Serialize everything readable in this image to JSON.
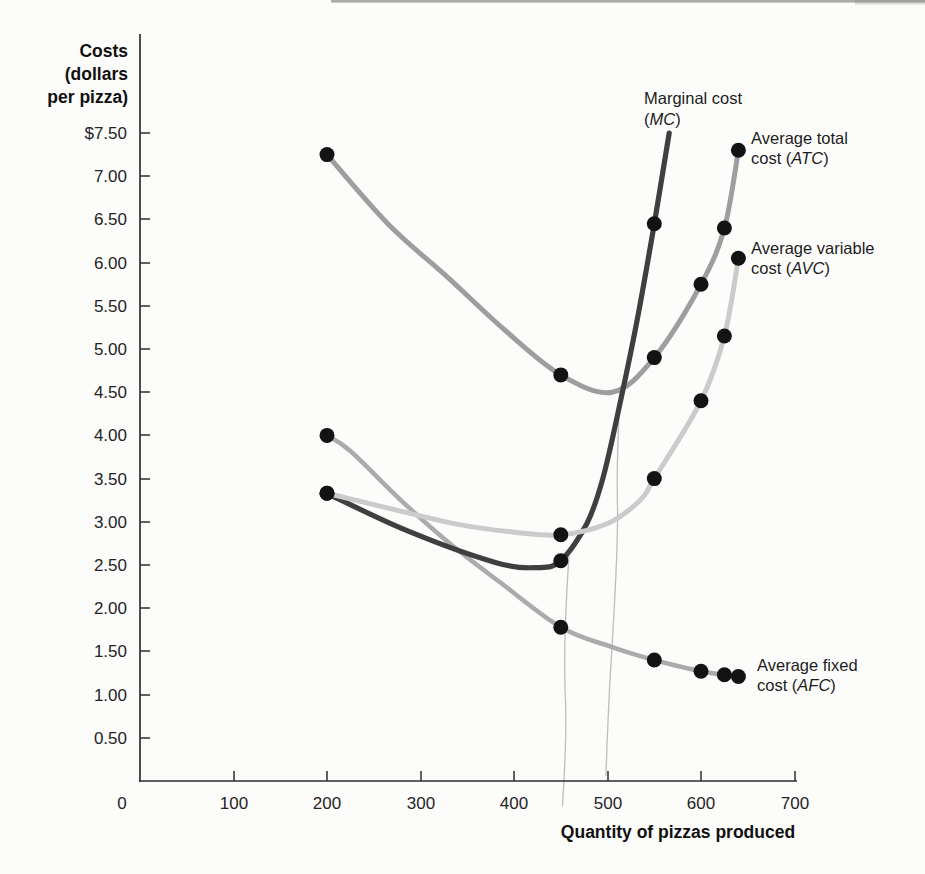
{
  "axes": {
    "y_title_lines": [
      "Costs",
      "(dollars",
      "per pizza)"
    ],
    "y_tick_labels": [
      "$7.50",
      "7.00",
      "6.50",
      "6.00",
      "5.50",
      "5.00",
      "4.50",
      "4.00",
      "3.50",
      "3.00",
      "2.50",
      "2.00",
      "1.50",
      "1.00",
      "0.50"
    ],
    "x_tick_labels": [
      "100",
      "200",
      "300",
      "400",
      "500",
      "600",
      "700"
    ],
    "origin_label": "0"
  },
  "chart_data": {
    "type": "line",
    "title": "",
    "xlabel": "Quantity of pizzas produced",
    "ylabel": "Costs (dollars per pizza)",
    "xlim": [
      0,
      700
    ],
    "ylim": [
      0,
      7.75
    ],
    "x_ticks": [
      100,
      200,
      300,
      400,
      500,
      600,
      700
    ],
    "y_tick_min": 0.5,
    "y_tick_max": 7.5,
    "y_tick_step": 0.5,
    "grid": false,
    "legend": "inline labels at right ends of curves",
    "dot_color": "#131313",
    "dot_radius": 7.5,
    "series": [
      {
        "key": "mc",
        "name": "Marginal cost (MC)",
        "abbr": "MC",
        "color": "#3f3f3f",
        "width": 5.2,
        "z": 3,
        "label": {
          "l1": "Marginal cost",
          "pre": "(",
          "abbr": "MC",
          "post": ")"
        },
        "dots": [
          [
            200,
            3.33
          ],
          [
            450,
            2.55
          ],
          [
            550,
            6.45
          ]
        ],
        "curve": [
          [
            200,
            3.33
          ],
          [
            285,
            2.9
          ],
          [
            380,
            2.53
          ],
          [
            425,
            2.47
          ],
          [
            450,
            2.55
          ],
          [
            478,
            2.98
          ],
          [
            495,
            3.5
          ],
          [
            512,
            4.3
          ],
          [
            532,
            5.35
          ],
          [
            550,
            6.45
          ],
          [
            566,
            7.5
          ]
        ]
      },
      {
        "key": "atc",
        "name": "Average total cost (ATC)",
        "abbr": "ATC",
        "color": "#9e9e9e",
        "width": 5,
        "z": 2,
        "label": {
          "l1": "Average total",
          "pre": "cost (",
          "abbr": "ATC",
          "post": ")"
        },
        "dots": [
          [
            200,
            7.25
          ],
          [
            450,
            4.7
          ],
          [
            550,
            4.9
          ],
          [
            600,
            5.75
          ],
          [
            625,
            6.4
          ],
          [
            640,
            7.3
          ]
        ],
        "curve": [
          [
            200,
            7.25
          ],
          [
            265,
            6.45
          ],
          [
            330,
            5.82
          ],
          [
            390,
            5.22
          ],
          [
            450,
            4.7
          ],
          [
            505,
            4.5
          ],
          [
            550,
            4.9
          ],
          [
            600,
            5.75
          ],
          [
            625,
            6.4
          ],
          [
            640,
            7.3
          ]
        ]
      },
      {
        "key": "avc",
        "name": "Average variable cost (AVC)",
        "abbr": "AVC",
        "color": "#cbcbcb",
        "width": 5,
        "z": 4,
        "label": {
          "l1": "Average variable",
          "pre": "cost (",
          "abbr": "AVC",
          "post": ")"
        },
        "dots": [
          [
            200,
            3.33
          ],
          [
            450,
            2.85
          ],
          [
            550,
            3.5
          ],
          [
            600,
            4.4
          ],
          [
            625,
            5.15
          ],
          [
            640,
            6.05
          ]
        ],
        "curve": [
          [
            200,
            3.33
          ],
          [
            280,
            3.12
          ],
          [
            340,
            2.97
          ],
          [
            400,
            2.88
          ],
          [
            450,
            2.85
          ],
          [
            500,
            2.98
          ],
          [
            535,
            3.25
          ],
          [
            550,
            3.5
          ],
          [
            600,
            4.4
          ],
          [
            625,
            5.15
          ],
          [
            640,
            6.05
          ]
        ]
      },
      {
        "key": "afc",
        "name": "Average fixed cost (AFC)",
        "abbr": "AFC",
        "color": "#ababab",
        "width": 4.5,
        "z": 1,
        "label": {
          "l1": "Average fixed",
          "pre": "cost (",
          "abbr": "AFC",
          "post": ")"
        },
        "dots": [
          [
            200,
            4.0
          ],
          [
            450,
            1.78
          ],
          [
            550,
            1.4
          ],
          [
            600,
            1.27
          ],
          [
            625,
            1.23
          ],
          [
            640,
            1.21
          ]
        ],
        "curve": [
          [
            200,
            4.0
          ],
          [
            225,
            3.82
          ],
          [
            280,
            3.24
          ],
          [
            330,
            2.76
          ],
          [
            385,
            2.3
          ],
          [
            450,
            1.78
          ],
          [
            505,
            1.55
          ],
          [
            550,
            1.4
          ],
          [
            600,
            1.27
          ],
          [
            625,
            1.23
          ],
          [
            640,
            1.21
          ]
        ]
      }
    ]
  }
}
